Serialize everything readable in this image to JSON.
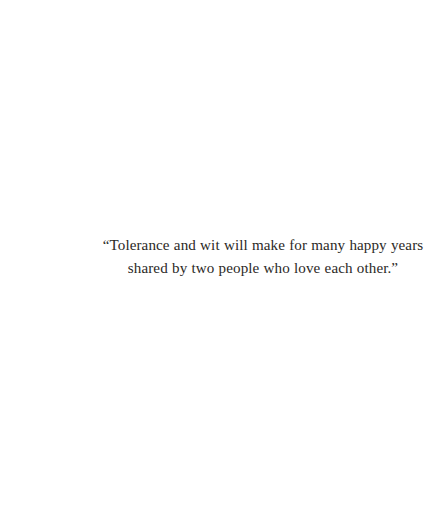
{
  "page": {
    "background_color": "#ffffff",
    "width": 446,
    "height": 510
  },
  "quote": {
    "text_color": "#2b2926",
    "alignment": "center",
    "full_text": "“Tolerance and wit will make for many happy years shared by two people who love each other.”",
    "lines": [
      "“Tolerance and wit will make for many happy years",
      "shared by two people who love each other.”"
    ],
    "opening_quote_mark": "“",
    "closing_quote_mark": "”"
  }
}
